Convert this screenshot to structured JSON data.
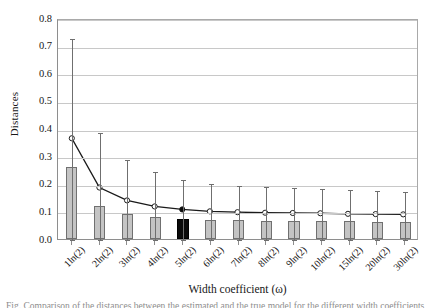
{
  "chart_data": {
    "type": "bar",
    "title": "",
    "xlabel": "Width coefficient (ω)",
    "ylabel": "Distances",
    "ylim": [
      0.0,
      0.8
    ],
    "ytick_step": 0.1,
    "grid": true,
    "legend": "none",
    "categories": [
      "1ln(2)",
      "2ln(2)",
      "3ln(2)",
      "4ln(2)",
      "5ln(2)",
      "6ln(2)",
      "7ln(2)",
      "8ln(2)",
      "9ln(2)",
      "10ln(2)",
      "15ln(2)",
      "20ln(2)",
      "30ln(2)"
    ],
    "ytick_labels": [
      "0.0",
      "0.1",
      "0.2",
      "0.3",
      "0.4",
      "0.5",
      "0.6",
      "0.7",
      "0.8"
    ],
    "ytick_values": [
      0.0,
      0.1,
      0.2,
      0.3,
      0.4,
      0.5,
      0.6,
      0.7,
      0.8
    ],
    "series": [
      {
        "name": "bars",
        "kind": "bar",
        "values": [
          0.26,
          0.118,
          0.091,
          0.08,
          0.072,
          0.069,
          0.068,
          0.067,
          0.066,
          0.065,
          0.064,
          0.063,
          0.062
        ],
        "highlight_index": 4,
        "fill": "#c4c4c4",
        "highlight_fill": "#0b0b0b",
        "edge": "#707070"
      },
      {
        "name": "line",
        "kind": "line",
        "values": [
          0.368,
          0.188,
          0.141,
          0.119,
          0.108,
          0.101,
          0.098,
          0.096,
          0.095,
          0.094,
          0.092,
          0.091,
          0.09
        ],
        "marker": "circle-open",
        "highlight_index": 4,
        "color": "#1a1a1a",
        "error_upper": [
          0.731,
          0.391,
          0.295,
          0.248,
          0.222,
          0.208,
          0.2,
          0.195,
          0.191,
          0.188,
          0.183,
          0.18,
          0.177
        ],
        "error_lower": [
          0.005,
          0.003,
          0.003,
          0.002,
          0.002,
          0.002,
          0.002,
          0.002,
          0.002,
          0.002,
          0.002,
          0.002,
          0.002
        ]
      }
    ]
  },
  "axis": {
    "y_title": "Distances",
    "x_title": "Width coefficient (ω)"
  },
  "caption": {
    "text": "Fig. Comparison of the distances between the estimated and the true model for the different width coefficients"
  }
}
